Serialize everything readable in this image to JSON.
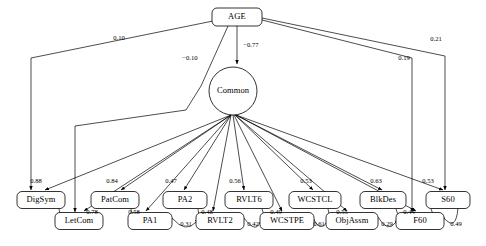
{
  "diagram": {
    "type": "path-diagram",
    "background_color": "#ffffff",
    "stroke_color": "#000000",
    "nodes": [
      {
        "id": "age",
        "label": "AGE",
        "shape": "rounded-rect",
        "cx": 237,
        "cy": 17,
        "w": 50,
        "h": 18
      },
      {
        "id": "common",
        "label": "Common",
        "shape": "ellipse",
        "cx": 233,
        "cy": 91,
        "rx": 24,
        "ry": 24
      },
      {
        "id": "digsym",
        "label": "DigSym",
        "shape": "rounded-rect",
        "cx": 41,
        "cy": 200,
        "w": 48,
        "h": 17
      },
      {
        "id": "letcom",
        "label": "LetCom",
        "shape": "rounded-rect",
        "cx": 79,
        "cy": 221,
        "w": 48,
        "h": 17
      },
      {
        "id": "patcom",
        "label": "PatCom",
        "shape": "rounded-rect",
        "cx": 115,
        "cy": 200,
        "w": 48,
        "h": 17
      },
      {
        "id": "pa1",
        "label": "PA1",
        "shape": "rounded-rect",
        "cx": 150,
        "cy": 221,
        "w": 44,
        "h": 17
      },
      {
        "id": "pa2",
        "label": "PA2",
        "shape": "rounded-rect",
        "cx": 185,
        "cy": 200,
        "w": 44,
        "h": 17
      },
      {
        "id": "rvlt2",
        "label": "RVLT2",
        "shape": "rounded-rect",
        "cx": 220,
        "cy": 221,
        "w": 48,
        "h": 17
      },
      {
        "id": "rvlt6",
        "label": "RVLT6",
        "shape": "rounded-rect",
        "cx": 249,
        "cy": 200,
        "w": 48,
        "h": 17
      },
      {
        "id": "wcstpe",
        "label": "WCSTPE",
        "shape": "rounded-rect",
        "cx": 287,
        "cy": 221,
        "w": 54,
        "h": 17
      },
      {
        "id": "wcstcl",
        "label": "WCSTCL",
        "shape": "rounded-rect",
        "cx": 315,
        "cy": 200,
        "w": 52,
        "h": 17
      },
      {
        "id": "objassm",
        "label": "ObjAssm",
        "shape": "rounded-rect",
        "cx": 352,
        "cy": 221,
        "w": 52,
        "h": 17
      },
      {
        "id": "blkdes",
        "label": "BlkDes",
        "shape": "rounded-rect",
        "cx": 383,
        "cy": 200,
        "w": 46,
        "h": 17
      },
      {
        "id": "f60",
        "label": "F60",
        "shape": "rounded-rect",
        "cx": 420,
        "cy": 221,
        "w": 48,
        "h": 17
      },
      {
        "id": "s60",
        "label": "S60",
        "shape": "rounded-rect",
        "cx": 448,
        "cy": 200,
        "w": 44,
        "h": 17
      }
    ],
    "edges": [
      {
        "id": "age-digsym",
        "from": "age",
        "to": "digsym",
        "value": "0.10",
        "label_x": 119,
        "label_y": 38
      },
      {
        "id": "age-common",
        "from": "age",
        "to": "common",
        "value": "−0.77",
        "label_x": 250,
        "label_y": 45
      },
      {
        "id": "age-letcom",
        "from": "age",
        "to": "letcom",
        "value": "−0.10",
        "label_x": 190,
        "label_y": 58
      },
      {
        "id": "age-f60",
        "from": "age",
        "to": "f60",
        "value": "0.19",
        "label_x": 404,
        "label_y": 58
      },
      {
        "id": "age-s60",
        "from": "age",
        "to": "s60",
        "value": "0.21",
        "label_x": 436,
        "label_y": 39
      },
      {
        "id": "common-digsym",
        "from": "common",
        "to": "digsym",
        "value": "0.88",
        "label_x": 36,
        "label_y": 181
      },
      {
        "id": "common-letcom",
        "from": "common",
        "to": "letcom",
        "value": "0.78",
        "label_x": 91,
        "label_y": 212
      },
      {
        "id": "common-patcom",
        "from": "common",
        "to": "patcom",
        "value": "0.84",
        "label_x": 112,
        "label_y": 181
      },
      {
        "id": "common-pa1",
        "from": "common",
        "to": "pa1",
        "value": "0.58",
        "label_x": 135,
        "label_y": 212
      },
      {
        "id": "common-pa2",
        "from": "common",
        "to": "pa2",
        "value": "0.47",
        "label_x": 171,
        "label_y": 181
      },
      {
        "id": "common-rvlt2",
        "from": "common",
        "to": "rvlt2",
        "value": "0.48",
        "label_x": 206,
        "label_y": 212
      },
      {
        "id": "common-rvlt6",
        "from": "common",
        "to": "rvlt6",
        "value": "0.56",
        "label_x": 235,
        "label_y": 181
      },
      {
        "id": "common-wcstpe",
        "from": "common",
        "to": "wcstpe",
        "value": "0.49",
        "label_x": 276,
        "label_y": 212
      },
      {
        "id": "common-wcstcl",
        "from": "common",
        "to": "wcstcl",
        "value": "0.53",
        "label_x": 306,
        "label_y": 181
      },
      {
        "id": "common-objassm",
        "from": "common",
        "to": "objassm",
        "value": "0.55",
        "label_x": 341,
        "label_y": 212
      },
      {
        "id": "common-blkdes",
        "from": "common",
        "to": "blkdes",
        "value": "0.63",
        "label_x": 376,
        "label_y": 181
      },
      {
        "id": "common-f60",
        "from": "common",
        "to": "f60",
        "value": "0.44",
        "label_x": 409,
        "label_y": 212
      },
      {
        "id": "common-s60",
        "from": "common",
        "to": "s60",
        "value": "0.53",
        "label_x": 428,
        "label_y": 181
      }
    ],
    "correlations": [
      {
        "id": "pa1-rvlt2",
        "from": "pa1",
        "to": "rvlt2",
        "value": "0.31",
        "label_x": 186,
        "label_y": 224
      },
      {
        "id": "rvlt2-wcstpe",
        "from": "rvlt2",
        "to": "wcstpe",
        "value": "0.42",
        "label_x": 252,
        "label_y": 224
      },
      {
        "id": "wcstpe-objassm",
        "from": "wcstpe",
        "to": "objassm",
        "value": "0.61",
        "label_x": 318,
        "label_y": 224
      },
      {
        "id": "objassm-f60",
        "from": "objassm",
        "to": "f60",
        "value": "0.29",
        "label_x": 386,
        "label_y": 224
      },
      {
        "id": "f60-s60",
        "from": "f60",
        "to": "s60",
        "value": "0.49",
        "label_x": 456,
        "label_y": 224
      }
    ]
  }
}
